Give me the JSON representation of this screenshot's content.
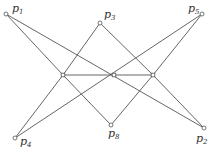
{
  "diagram": {
    "type": "line-configuration",
    "labeled_points": [
      {
        "id": "p1",
        "base": "p",
        "sub": "1",
        "x": 6,
        "y": 14,
        "lx": 12,
        "ly": 12
      },
      {
        "id": "p3",
        "base": "p",
        "sub": "3",
        "x": 100,
        "y": 23,
        "lx": 104,
        "ly": 18
      },
      {
        "id": "p5",
        "base": "p",
        "sub": "5",
        "x": 202,
        "y": 14,
        "lx": 188,
        "ly": 12
      },
      {
        "id": "p4",
        "base": "p",
        "sub": "4",
        "x": 15,
        "y": 138,
        "lx": 20,
        "ly": 145
      },
      {
        "id": "p8",
        "base": "p",
        "sub": "8",
        "x": 111,
        "y": 125,
        "lx": 108,
        "ly": 137
      },
      {
        "id": "p2",
        "base": "p",
        "sub": "2",
        "x": 204,
        "y": 128,
        "lx": 196,
        "ly": 142
      }
    ],
    "inner_points": [
      {
        "id": "m1",
        "x": 63,
        "y": 75
      },
      {
        "id": "m2",
        "x": 114,
        "y": 75
      },
      {
        "id": "m3",
        "x": 153,
        "y": 75
      }
    ],
    "edges": [
      [
        "p1",
        "m1"
      ],
      [
        "p1",
        "p2"
      ],
      [
        "p3",
        "m1"
      ],
      [
        "p3",
        "m3"
      ],
      [
        "p5",
        "m3"
      ],
      [
        "p5",
        "p4"
      ],
      [
        "p4",
        "m1"
      ],
      [
        "p2",
        "m3"
      ],
      [
        "m1",
        "m3"
      ],
      [
        "m1",
        "p8"
      ],
      [
        "m3",
        "p8"
      ]
    ]
  }
}
